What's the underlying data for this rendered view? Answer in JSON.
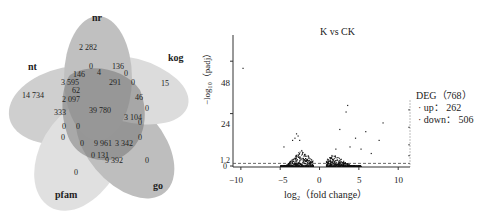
{
  "venn": {
    "sets": [
      {
        "name": "nr",
        "color": "#8a8a8a"
      },
      {
        "name": "kog",
        "color": "#c4c4c4"
      },
      {
        "name": "go",
        "color": "#7c7c7c"
      },
      {
        "name": "pfam",
        "color": "#d0d0d0"
      },
      {
        "name": "nt",
        "color": "#a0a0a0"
      }
    ],
    "regions": [
      {
        "label": "2 282",
        "x": 88,
        "y": 47
      },
      {
        "label": "0",
        "x": 91,
        "y": 66
      },
      {
        "label": "136",
        "x": 118,
        "y": 66
      },
      {
        "label": "15",
        "x": 165,
        "y": 83
      },
      {
        "label": "14 734",
        "x": 33,
        "y": 95
      },
      {
        "label": "146",
        "x": 79,
        "y": 74
      },
      {
        "label": "4",
        "x": 99,
        "y": 72
      },
      {
        "label": "0",
        "x": 126,
        "y": 73
      },
      {
        "label": "3 595",
        "x": 70,
        "y": 82
      },
      {
        "label": "291",
        "x": 115,
        "y": 82
      },
      {
        "label": "0",
        "x": 133,
        "y": 82
      },
      {
        "label": "62",
        "x": 76,
        "y": 90
      },
      {
        "label": "2 097",
        "x": 71,
        "y": 99
      },
      {
        "label": "46",
        "x": 139,
        "y": 97
      },
      {
        "label": "333",
        "x": 60,
        "y": 112
      },
      {
        "label": "39 780",
        "x": 100,
        "y": 110
      },
      {
        "label": "0",
        "x": 147,
        "y": 108
      },
      {
        "label": "3 104",
        "x": 133,
        "y": 117
      },
      {
        "label": "0",
        "x": 64,
        "y": 126
      },
      {
        "label": "0",
        "x": 78,
        "y": 126
      },
      {
        "label": "0",
        "x": 140,
        "y": 122
      },
      {
        "label": "0",
        "x": 63,
        "y": 137
      },
      {
        "label": "0",
        "x": 140,
        "y": 137
      },
      {
        "label": "0",
        "x": 82,
        "y": 143
      },
      {
        "label": "9 961",
        "x": 103,
        "y": 143
      },
      {
        "label": "3 342",
        "x": 124,
        "y": 143
      },
      {
        "label": "0",
        "x": 93,
        "y": 155
      },
      {
        "label": "131",
        "x": 103,
        "y": 155
      },
      {
        "label": "9 392",
        "x": 114,
        "y": 160
      },
      {
        "label": "0",
        "x": 147,
        "y": 160
      },
      {
        "label": "0",
        "x": 76,
        "y": 172
      }
    ]
  },
  "chart_data": {
    "type": "scatter",
    "title": "K vs CK",
    "xlabel": "log2 (fold change)",
    "ylabel": "-log10 (padj)",
    "xlim": [
      -11,
      11.5
    ],
    "ylim": [
      0,
      60
    ],
    "xticks": [
      -10,
      -5,
      0,
      5,
      10
    ],
    "yticks": [
      0,
      1.2,
      24,
      48
    ],
    "threshold_line_y": 1.2,
    "legend": {
      "title": "DEG（768）",
      "items": [
        {
          "label": "up： 262",
          "value": 262
        },
        {
          "label": "down： 506",
          "value": 506
        }
      ]
    },
    "outlier_points": [
      [
        -9.8,
        45
      ],
      [
        -3.0,
        15
      ],
      [
        -2.8,
        14
      ],
      [
        -3.2,
        13
      ],
      [
        -2.6,
        12
      ],
      [
        -4.6,
        9
      ],
      [
        -3.5,
        12
      ],
      [
        3.5,
        28
      ],
      [
        3.3,
        25
      ],
      [
        2.5,
        17
      ],
      [
        5.8,
        16
      ],
      [
        8.0,
        20
      ],
      [
        7.5,
        12
      ],
      [
        4.5,
        13
      ],
      [
        3.8,
        9
      ],
      [
        2.0,
        8
      ],
      [
        5.2,
        8
      ],
      [
        6.5,
        6
      ],
      [
        11.3,
        26
      ],
      [
        11.3,
        18
      ],
      [
        11.3,
        10
      ],
      [
        11.3,
        5
      ]
    ],
    "dense_clusters": [
      {
        "x_center": -2.3,
        "x_range": [
          -5,
          -0.8
        ],
        "peak_y": 8
      },
      {
        "x_center": 1.8,
        "x_range": [
          0.8,
          5.2
        ],
        "peak_y": 6
      }
    ]
  },
  "ui": {
    "title_text": "K vs CK",
    "ylabel_text": "−log₁₀（padj）",
    "xlabel_text": "log₂（fold change）",
    "legend_title": "DEG（768）",
    "legend_up": "· up： 262",
    "legend_down": "· down： 506",
    "ytick_48": "48",
    "ytick_24": "24",
    "ytick_12": "1.2",
    "ytick_0": "0",
    "xtick_m10": "−10",
    "xtick_m5": "−5",
    "xtick_0": "0",
    "xtick_5": "5",
    "xtick_10": "10",
    "set_nr": "nr",
    "set_kog": "kog",
    "set_go": "go",
    "set_pfam": "pfam",
    "set_nt": "nt"
  }
}
